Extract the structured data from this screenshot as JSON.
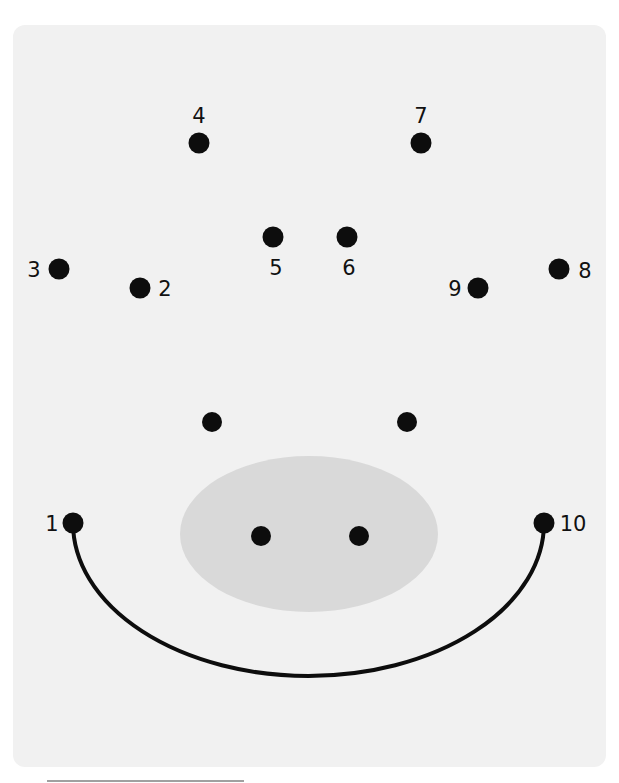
{
  "worksheet": {
    "title": "Dot-to-dot pig face",
    "colors": {
      "background": "#ffffff",
      "panel": "#f1f1f1",
      "dot": "#0d0d0d",
      "snout": "#d9d9d9",
      "smile": "#0d0d0d",
      "footer_line": "#a0a0a0"
    },
    "numbered_dots": [
      {
        "label": "1",
        "x": 73,
        "y": 523,
        "label_x": 52,
        "label_y": 531
      },
      {
        "label": "2",
        "x": 140,
        "y": 288,
        "label_x": 165,
        "label_y": 296
      },
      {
        "label": "3",
        "x": 59,
        "y": 269,
        "label_x": 34,
        "label_y": 277
      },
      {
        "label": "4",
        "x": 199,
        "y": 143,
        "label_x": 199,
        "label_y": 123
      },
      {
        "label": "5",
        "x": 273,
        "y": 237,
        "label_x": 276,
        "label_y": 275
      },
      {
        "label": "6",
        "x": 347,
        "y": 237,
        "label_x": 349,
        "label_y": 275
      },
      {
        "label": "7",
        "x": 421,
        "y": 143,
        "label_x": 421,
        "label_y": 123
      },
      {
        "label": "8",
        "x": 559,
        "y": 269,
        "label_x": 585,
        "label_y": 278
      },
      {
        "label": "9",
        "x": 478,
        "y": 288,
        "label_x": 455,
        "label_y": 296
      },
      {
        "label": "10",
        "x": 544,
        "y": 523,
        "label_x": 573,
        "label_y": 531
      }
    ],
    "eyes": [
      {
        "name": "left",
        "x": 212,
        "y": 422
      },
      {
        "name": "right",
        "x": 407,
        "y": 422
      }
    ],
    "snout": {
      "cx": 309,
      "cy": 534,
      "rx": 129,
      "ry": 78
    },
    "nostrils": [
      {
        "name": "left",
        "x": 261,
        "y": 536
      },
      {
        "name": "right",
        "x": 359,
        "y": 536
      }
    ],
    "smile": {
      "start_x": 73,
      "start_y": 523,
      "end_x": 544,
      "end_y": 523,
      "bottom_y": 676
    }
  }
}
